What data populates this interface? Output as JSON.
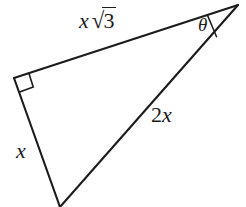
{
  "figure": {
    "kind": "geometry-diagram",
    "shape": "right-triangle",
    "background_color": "#ffffff",
    "stroke_color": "#1b1b1b",
    "stroke_width": 2,
    "width": 246,
    "height": 207,
    "vertices": {
      "right_angle_vertex": {
        "x": 14,
        "y": 78
      },
      "theta_vertex": {
        "x": 238,
        "y": 5
      },
      "bottom_vertex": {
        "x": 60,
        "y": 206
      }
    },
    "markers": {
      "right_angle_square": {
        "name": "right-angle-mark",
        "vertex": {
          "x": 14,
          "y": 78
        },
        "size": 15
      },
      "theta_arc": {
        "name": "angle-arc",
        "vertex": {
          "x": 238,
          "y": 5
        },
        "radius": 32
      }
    },
    "labels": {
      "hypotenuse": {
        "text": "x √3",
        "variable": "x",
        "radical_sign": "√",
        "radicand": "3",
        "side": "top",
        "position": {
          "x": 79,
          "y": 9
        }
      },
      "short_leg": {
        "text": "x",
        "side": "left",
        "position": {
          "x": 16,
          "y": 140
        }
      },
      "long_leg": {
        "coefficient": "2",
        "variable": "x",
        "text": "2x",
        "side": "right",
        "position": {
          "x": 151,
          "y": 104
        }
      },
      "angle": {
        "text": "θ",
        "position": {
          "x": 198,
          "y": 15
        }
      }
    }
  }
}
